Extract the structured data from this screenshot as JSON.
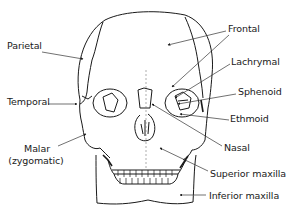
{
  "diagram": {
    "colors": {
      "line": "#1a1a1a",
      "leader": "#555555",
      "background": "#ffffff"
    },
    "labels": {
      "parietal": "Parietal",
      "temporal": "Temporal",
      "malar_line1": "Malar",
      "malar_line2": "(zygomatic)",
      "frontal": "Frontal",
      "lachrymal": "Lachrymal",
      "sphenoid": "Sphenoid",
      "ethmoid": "Ethmoid",
      "nasal": "Nasal",
      "superior_maxilla": "Superior maxilla",
      "inferior_maxilla": "Inferior maxilla"
    }
  }
}
